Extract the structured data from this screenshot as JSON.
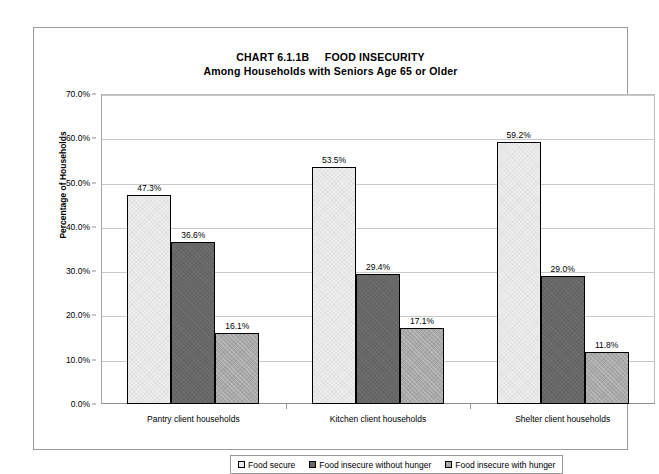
{
  "chart_data": {
    "type": "bar",
    "title": "CHART 6.1.1B     FOOD INSECURITY",
    "subtitle": "Among Households with Seniors Age 65 or Older",
    "xlabel": "",
    "ylabel": "Percentage of Households",
    "ylim": [
      0,
      70
    ],
    "ytick_step": 10,
    "grid": true,
    "legend_position": "bottom",
    "categories": [
      "Pantry client households",
      "Kitchen client households",
      "Shelter client households"
    ],
    "series": [
      {
        "name": "Food secure",
        "values": [
          47.3,
          53.5,
          59.2
        ],
        "color": "#ededed"
      },
      {
        "name": "Food insecure without hunger",
        "values": [
          36.6,
          29.4,
          29.0
        ],
        "color": "#676767"
      },
      {
        "name": "Food insecure with hunger",
        "values": [
          16.1,
          17.1,
          11.8
        ],
        "color": "#a9a9a9"
      }
    ],
    "value_labels": [
      [
        "47.3%",
        "36.6%",
        "16.1%"
      ],
      [
        "53.5%",
        "29.4%",
        "17.1%"
      ],
      [
        "59.2%",
        "29.0%",
        "11.8%"
      ]
    ],
    "ytick_labels": [
      "70.0%",
      "60.0%",
      "50.0%",
      "40.0%",
      "30.0%",
      "20.0%",
      "10.0%",
      "0.0%"
    ],
    "ytick_values": [
      70,
      60,
      50,
      40,
      30,
      20,
      10,
      0
    ]
  }
}
